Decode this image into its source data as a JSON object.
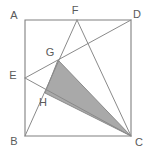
{
  "figure": {
    "type": "plane-geometry-diagram",
    "background_color": "#ffffff",
    "stroke_color": "#808080",
    "shade_color": "#a9a9a9",
    "label_color": "#5a5a5a"
  },
  "points": {
    "A": {
      "label": "A",
      "x": 25,
      "y": 20,
      "label_x": 14,
      "label_y": 16
    },
    "B": {
      "label": "B",
      "x": 25,
      "y": 136,
      "label_x": 14,
      "label_y": 142
    },
    "C": {
      "label": "C",
      "x": 131,
      "y": 136,
      "label_x": 139,
      "label_y": 143
    },
    "D": {
      "label": "D",
      "x": 131,
      "y": 20,
      "label_x": 137,
      "label_y": 15
    },
    "E": {
      "label": "E",
      "x": 25,
      "y": 78,
      "label_x": 13,
      "label_y": 76
    },
    "F": {
      "label": "F",
      "x": 77,
      "y": 20,
      "label_x": 75,
      "label_y": 11
    },
    "G": {
      "label": "G",
      "x": 58,
      "y": 60,
      "label_x": 50,
      "label_y": 53
    },
    "H": {
      "label": "H",
      "x": 45,
      "y": 93,
      "label_x": 43,
      "label_y": 103
    }
  },
  "square": {
    "name": "ABCD",
    "vertices": [
      "A",
      "D",
      "C",
      "B"
    ],
    "path": "25,20 131,20 131,136 25,136"
  },
  "segments": [
    {
      "name": "AD",
      "from": "A",
      "to": "D",
      "kind": "edge"
    },
    {
      "name": "DC",
      "from": "D",
      "to": "C",
      "kind": "edge"
    },
    {
      "name": "CB",
      "from": "C",
      "to": "B",
      "kind": "edge"
    },
    {
      "name": "BA",
      "from": "B",
      "to": "A",
      "kind": "edge"
    },
    {
      "name": "FB",
      "from": "F",
      "to": "B",
      "kind": "cevian"
    },
    {
      "name": "FC",
      "from": "F",
      "to": "C",
      "kind": "cevian"
    },
    {
      "name": "ED",
      "from": "E",
      "to": "D",
      "kind": "cevian"
    },
    {
      "name": "EC",
      "from": "E",
      "to": "C",
      "kind": "cevian"
    }
  ],
  "intersections": [
    {
      "name": "G",
      "of": [
        "FB",
        "ED"
      ]
    },
    {
      "name": "H",
      "of": [
        "FB",
        "EC"
      ]
    }
  ],
  "shaded_region": {
    "name": "triangle-GHC",
    "vertices": [
      "G",
      "H",
      "C"
    ],
    "path": "58,60 45,93 131,136",
    "fill": "#a9a9a9"
  }
}
